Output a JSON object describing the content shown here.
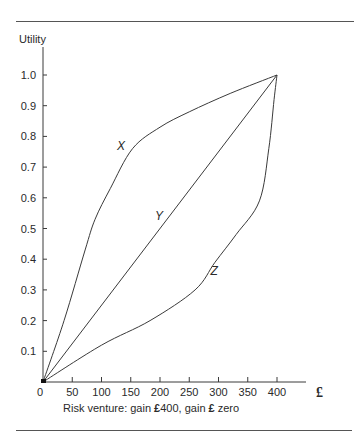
{
  "chart_data": {
    "type": "line",
    "title": "",
    "xlabel": "Risk venture: gain £400, gain £ zero",
    "xlabel_parts": {
      "prefix": "Risk venture: gain ",
      "sym1": "£",
      "mid": "400, gain ",
      "sym2": "£",
      "suffix": " zero"
    },
    "ylabel": "Utility",
    "x_unit_symbol": "£",
    "xlim": [
      0,
      400
    ],
    "ylim": [
      0,
      1.0
    ],
    "x_ticks": [
      0,
      50,
      100,
      150,
      200,
      250,
      300,
      350,
      400
    ],
    "y_ticks": [
      0.1,
      0.2,
      0.3,
      0.4,
      0.5,
      0.6,
      0.7,
      0.8,
      0.9,
      1.0
    ],
    "y_tick_labels": [
      "0.1",
      "0.2",
      "0.3",
      "0.4",
      "0.5",
      "0.6",
      "0.7",
      "0.8",
      "0.9",
      "1.0"
    ],
    "grid": false,
    "legend": "none (curves labelled inline)",
    "series": [
      {
        "name": "X",
        "label_at": [
          140,
          0.77
        ],
        "x": [
          0,
          36,
          72,
          89,
          115,
          153,
          200,
          250,
          320,
          400
        ],
        "y": [
          0,
          0.2,
          0.43,
          0.53,
          0.63,
          0.76,
          0.83,
          0.88,
          0.94,
          1.0
        ]
      },
      {
        "name": "Y",
        "label_at": [
          205,
          0.54
        ],
        "x": [
          0,
          400
        ],
        "y": [
          0,
          1.0
        ]
      },
      {
        "name": "Z",
        "label_at": [
          300,
          0.36
        ],
        "x": [
          0,
          100,
          183,
          260,
          294,
          330,
          370,
          386,
          395,
          400
        ],
        "y": [
          0,
          0.12,
          0.2,
          0.3,
          0.39,
          0.48,
          0.59,
          0.76,
          0.92,
          1.0
        ]
      }
    ]
  },
  "colors": {
    "line": "#3a3a3a",
    "text": "#2a2a2a",
    "rule": "#555555"
  }
}
